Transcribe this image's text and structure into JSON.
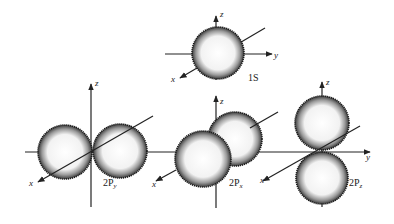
{
  "colors": {
    "ink": "#222222",
    "background": "#ffffff",
    "lobe_fill": "#f4f4f4"
  },
  "orbitals": [
    {
      "id": "1s",
      "label": "1S",
      "axes": {
        "x": "x",
        "y": "y",
        "z": "z"
      }
    },
    {
      "id": "2py",
      "label_main": "2P",
      "label_sub": "y",
      "axes": {
        "x": "x",
        "z": "z"
      }
    },
    {
      "id": "2px",
      "label_main": "2P",
      "label_sub": "x",
      "axes": {
        "x": "x",
        "z": "z"
      }
    },
    {
      "id": "2pz",
      "label_main": "2P",
      "label_sub": "z",
      "axes": {
        "x": "x",
        "y": "y",
        "z": "z"
      }
    }
  ]
}
